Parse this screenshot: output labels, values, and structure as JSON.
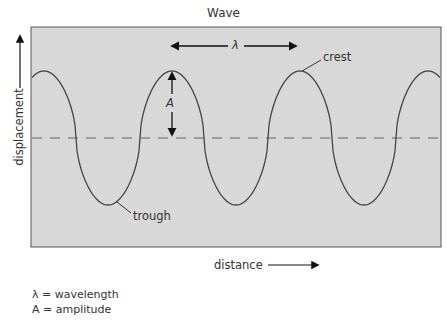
{
  "title": "Wave",
  "axes": {
    "ylabel": "displacement",
    "xlabel": "distance"
  },
  "annotations": {
    "wavelength_symbol": "λ",
    "amplitude_symbol": "A",
    "crest_label": "crest",
    "trough_label": "trough"
  },
  "legend": [
    {
      "symbol": "λ",
      "text": "λ = wavelength"
    },
    {
      "symbol": "A",
      "text": "A = amplitude"
    }
  ],
  "colors": {
    "plot_background": "#d8d8d8",
    "plot_border": "#555555",
    "wave_line": "#444444",
    "equilibrium_dash": "#666666",
    "arrow": "#111111"
  },
  "chart_data": {
    "type": "line",
    "title": "Wave",
    "xlabel": "distance",
    "ylabel": "displacement",
    "series": [
      {
        "name": "wave",
        "description": "periodic wave with flattened crests and troughs",
        "crest_count_visible": 4,
        "trough_count_visible": 3
      }
    ],
    "equilibrium_line": "dashed horizontal at zero displacement",
    "annotations": [
      "λ (wavelength) arrow spanning crest-to-crest",
      "A (amplitude) arrow from equilibrium to crest",
      "crest",
      "trough"
    ],
    "grid": false
  }
}
